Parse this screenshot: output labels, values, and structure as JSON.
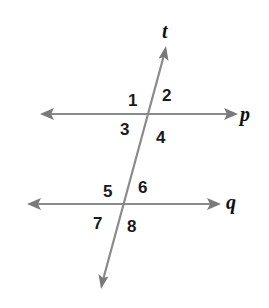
{
  "diagram": {
    "type": "parallel-lines-cut-by-transversal",
    "colors": {
      "line": "#8a8a8a",
      "text": "#1a1a1a"
    },
    "lines": {
      "transversal": {
        "label": "t"
      },
      "top": {
        "label": "p"
      },
      "bottom": {
        "label": "q"
      }
    },
    "angles": [
      {
        "id": 1,
        "label": "1"
      },
      {
        "id": 2,
        "label": "2"
      },
      {
        "id": 3,
        "label": "3"
      },
      {
        "id": 4,
        "label": "4"
      },
      {
        "id": 5,
        "label": "5"
      },
      {
        "id": 6,
        "label": "6"
      },
      {
        "id": 7,
        "label": "7"
      },
      {
        "id": 8,
        "label": "8"
      }
    ]
  }
}
